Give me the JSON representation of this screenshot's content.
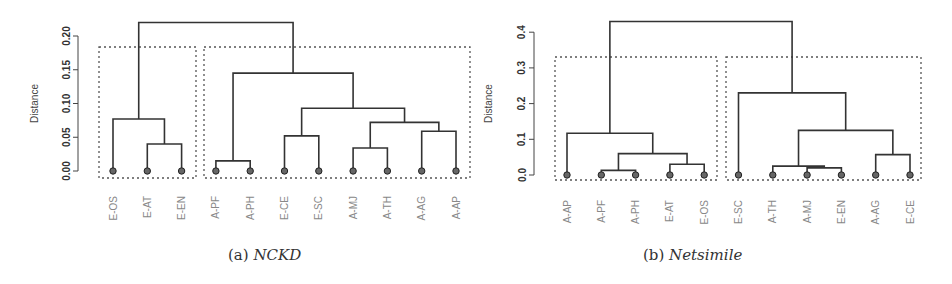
{
  "chart_data": [
    {
      "type": "dendrogram",
      "panel": "a",
      "caption_prefix": "(a)",
      "caption_name": "NCKD",
      "ylabel": "Distance",
      "ylim": [
        0,
        0.22
      ],
      "yticks": [
        "0.00",
        "0.05",
        "0.10",
        "0.15",
        "0.20"
      ],
      "ytick_values": [
        0,
        0.05,
        0.1,
        0.15,
        0.2
      ],
      "leaves": [
        "E-OS",
        "E-AT",
        "E-EN",
        "A-PF",
        "A-PH",
        "E-CE",
        "E-SC",
        "A-MJ",
        "A-TH",
        "A-AG",
        "A-AP"
      ],
      "clusters": [
        [
          "E-OS",
          "E-AT",
          "E-EN"
        ],
        [
          "A-PF",
          "A-PH",
          "E-CE",
          "E-SC",
          "A-MJ",
          "A-TH",
          "A-AG",
          "A-AP"
        ]
      ],
      "merges": [
        {
          "left": "A-PF",
          "right": "A-PH",
          "height": 0.015
        },
        {
          "left": "A-MJ",
          "right": "A-TH",
          "height": 0.034
        },
        {
          "left": "E-AT",
          "right": "E-EN",
          "height": 0.04
        },
        {
          "left": "E-CE",
          "right": "E-SC",
          "height": 0.052
        },
        {
          "left": "A-AG",
          "right": "A-AP",
          "height": 0.059
        },
        {
          "left": "(A-MJ,A-TH)",
          "right": "(A-AG,A-AP)",
          "height": 0.072
        },
        {
          "left": "E-OS",
          "right": "(E-AT,E-EN)",
          "height": 0.077
        },
        {
          "left": "(E-CE,E-SC)",
          "right": "(A-MJ,A-TH,A-AG,A-AP)",
          "height": 0.093
        },
        {
          "left": "(A-PF,A-PH)",
          "right": "(E-CE..A-AP)",
          "height": 0.145
        },
        {
          "left": "(E-OS,E-AT,E-EN)",
          "right": "(A-PF..A-AP)",
          "height": 0.22
        }
      ]
    },
    {
      "type": "dendrogram",
      "panel": "b",
      "caption_prefix": "(b)",
      "caption_name": "Netsimile",
      "ylabel": "Distance",
      "ylim": [
        0,
        0.43
      ],
      "yticks": [
        "0.0",
        "0.1",
        "0.2",
        "0.3",
        "0.4"
      ],
      "ytick_values": [
        0,
        0.1,
        0.2,
        0.3,
        0.4
      ],
      "leaves": [
        "A-AP",
        "A-PF",
        "A-PH",
        "E-AT",
        "E-OS",
        "E-SC",
        "A-TH",
        "A-MJ",
        "E-EN",
        "A-AG",
        "E-CE"
      ],
      "clusters": [
        [
          "A-AP",
          "A-PF",
          "A-PH",
          "E-AT",
          "E-OS"
        ],
        [
          "E-SC",
          "A-TH",
          "A-MJ",
          "E-EN",
          "A-AG",
          "E-CE"
        ]
      ],
      "merges": [
        {
          "left": "A-PF",
          "right": "A-PH",
          "height": 0.013
        },
        {
          "left": "A-MJ",
          "right": "E-EN",
          "height": 0.02
        },
        {
          "left": "A-TH",
          "right": "(A-MJ,E-EN)",
          "height": 0.025
        },
        {
          "left": "E-AT",
          "right": "E-OS",
          "height": 0.03
        },
        {
          "left": "A-AG",
          "right": "E-CE",
          "height": 0.057
        },
        {
          "left": "(A-PF,A-PH)",
          "right": "(E-AT,E-OS)",
          "height": 0.06
        },
        {
          "left": "A-AP",
          "right": "(A-PF,A-PH,E-AT,E-OS)",
          "height": 0.117
        },
        {
          "left": "(A-TH,A-MJ,E-EN)",
          "right": "(A-AG,E-CE)",
          "height": 0.125
        },
        {
          "left": "E-SC",
          "right": "(A-TH..E-CE)",
          "height": 0.23
        },
        {
          "left": "(A-AP..E-OS)",
          "right": "(E-SC..E-CE)",
          "height": 0.43
        }
      ]
    }
  ],
  "captions": {
    "a_prefix": "(a)",
    "a_name": "NCKD",
    "b_prefix": "(b)",
    "b_name": "Netsimile"
  },
  "colors": {
    "tree": "#333333",
    "box": "#555555",
    "label": "#888888",
    "axis": "#444444"
  }
}
